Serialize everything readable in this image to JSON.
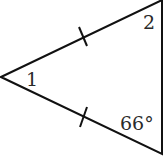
{
  "diagram": {
    "type": "isosceles-triangle",
    "vertices": {
      "left": {
        "x": 1,
        "y": 77
      },
      "top": {
        "x": 162,
        "y": 0
      },
      "bottom": {
        "x": 162,
        "y": 154
      }
    },
    "labels": {
      "angle1": "1",
      "angle2": "2",
      "angle_bottom": "66°"
    },
    "congruent_sides": [
      "left-top",
      "left-bottom"
    ],
    "stroke_color": "#111111",
    "label_color": "#2a2a2a"
  }
}
